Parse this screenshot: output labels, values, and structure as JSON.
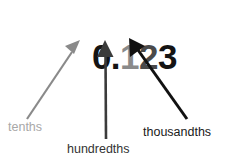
{
  "figure": {
    "type": "place-value-diagram",
    "background_color": "#ffffff",
    "width": 232,
    "height": 168
  },
  "number": {
    "full_text": "0.123",
    "parts": [
      {
        "text": "0.",
        "color": "#141414",
        "name": "whole-part"
      },
      {
        "text": "1",
        "color": "#8a8a8a",
        "name": "tenths-digit"
      },
      {
        "text": "2",
        "color": "#4a4a4a",
        "name": "hundredths-digit"
      },
      {
        "text": "3",
        "color": "#141414",
        "name": "thousandths-digit"
      }
    ]
  },
  "labels": {
    "tenths": "tenths",
    "hundredths": "hundredths",
    "thousandths": "thousandths"
  },
  "arrows": {
    "tenths": {
      "color": "#8a8a8a",
      "from_x": 27,
      "from_y": 119,
      "to_x": 80,
      "to_y": 40,
      "points_to": "tenths-digit"
    },
    "hundredths": {
      "color": "#3b3b3b",
      "from_x": 106,
      "from_y": 139,
      "to_x": 105,
      "to_y": 40,
      "points_to": "hundredths-digit"
    },
    "thousandths": {
      "color": "#111111",
      "from_x": 187,
      "from_y": 119,
      "to_x": 129,
      "to_y": 38,
      "points_to": "thousandths-digit"
    }
  }
}
